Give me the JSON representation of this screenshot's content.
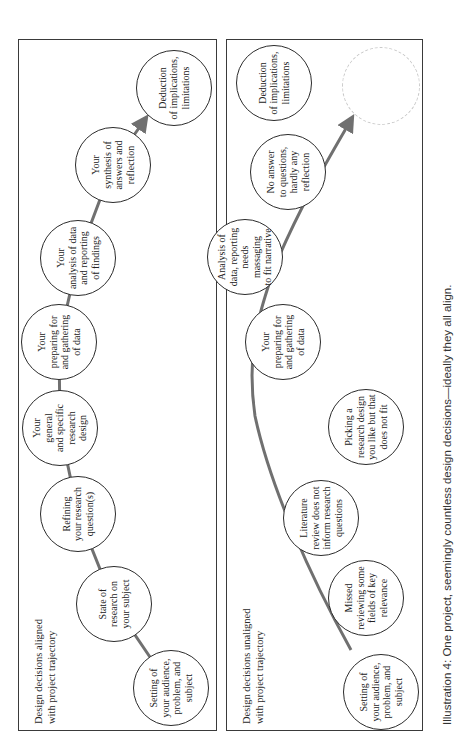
{
  "figure": {
    "caption": "Illustration 4: One project, seemingly countless design decisions—ideally they all align.",
    "orientation": "rotated 90 degrees counterclockwise",
    "line_color": "#707070",
    "border_color": "#3a3a3a"
  },
  "panels": [
    {
      "id": "aligned",
      "label": "Design decisions aligned\nwith project trajectory",
      "trajectory": "straight zigzag with arrow",
      "nodes": [
        {
          "text": "Setting of\nyour audience,\nproblem, and\nsubject"
        },
        {
          "text": "State of\nresearch on\nyour subject"
        },
        {
          "text": "Refining\nyour research\nquestion(s)"
        },
        {
          "text": "Your\ngeneral\nand specific\nresearch\ndesign"
        },
        {
          "text": "Your\npreparing for\nand gathering\nof data"
        },
        {
          "text": "Your\nanalysis of data\nand reporting\nof findings"
        },
        {
          "text": "Your\nsynthesis of\nanswers and\nreflection"
        },
        {
          "text": "Deduction\nof implications,\nlimitations"
        }
      ]
    },
    {
      "id": "unaligned",
      "label": "Design decisions unaligned\nwith project trajectory",
      "trajectory": "curved line with arrow pointing to empty dashed circle",
      "nodes": [
        {
          "text": "Setting of\nyour audience,\nproblem, and\nsubject"
        },
        {
          "text": "Missed\nreviewing some\nfields of key\nrelevance"
        },
        {
          "text": "Literature\nreview does not\ninform research\nquestions"
        },
        {
          "text": "Picking a\nresearch design\nyou like but that\ndoes not fit"
        },
        {
          "text": "Your\npreparing for\nand gathering\nof data"
        },
        {
          "text": "Analysis of\ndata, reporting\nneeds massaging\nto fit narrative"
        },
        {
          "text": "No answer\nto questions,\nhardly any\nreflection"
        },
        {
          "text": "Deduction\nof implications,\nlimitations"
        },
        {
          "text": ""
        }
      ]
    }
  ]
}
